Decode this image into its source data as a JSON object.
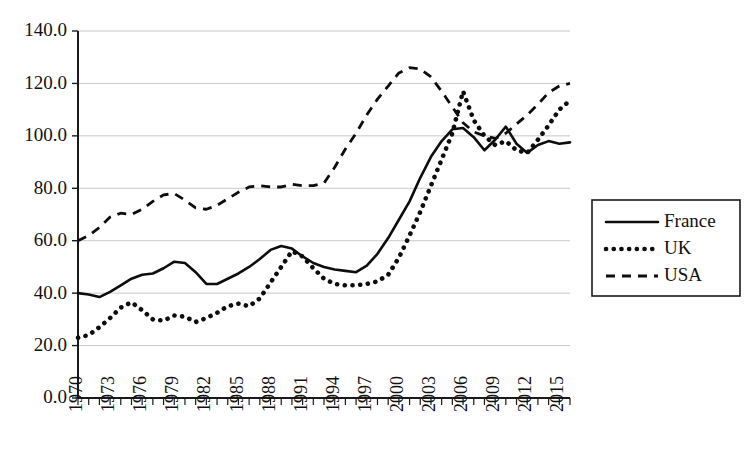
{
  "chart_data": {
    "type": "line",
    "title": "",
    "subtitle": "",
    "xlabel": "",
    "ylabel": "",
    "grid": true,
    "legend_position": "right",
    "xlim": [
      1970,
      2016
    ],
    "ylim": [
      0.0,
      140.0
    ],
    "y_ticks": [
      "0.0",
      "20.0",
      "40.0",
      "60.0",
      "80.0",
      "100.0",
      "120.0",
      "140.0"
    ],
    "y_tick_values": [
      0,
      20,
      40,
      60,
      80,
      100,
      120,
      140
    ],
    "x_tick_labels": [
      "1970",
      "1973",
      "1976",
      "1979",
      "1982",
      "1985",
      "1988",
      "1991",
      "1994",
      "1997",
      "2000",
      "2003",
      "2006",
      "2009",
      "2012",
      "2015"
    ],
    "x_tick_label_values": [
      1970,
      1973,
      1976,
      1979,
      1982,
      1985,
      1988,
      1991,
      1994,
      1997,
      2000,
      2003,
      2006,
      2009,
      2012,
      2015
    ],
    "x": [
      1970,
      1971,
      1972,
      1973,
      1974,
      1975,
      1976,
      1977,
      1978,
      1979,
      1980,
      1981,
      1982,
      1983,
      1984,
      1985,
      1986,
      1987,
      1988,
      1989,
      1990,
      1991,
      1992,
      1993,
      1994,
      1995,
      1996,
      1997,
      1998,
      1999,
      2000,
      2001,
      2002,
      2003,
      2004,
      2005,
      2006,
      2007,
      2008,
      2009,
      2010,
      2011,
      2012,
      2013,
      2014,
      2015,
      2016
    ],
    "series": [
      {
        "name": "France",
        "style": "solid",
        "color": "#0d0d0d",
        "values": [
          40.0,
          39.5,
          38.5,
          40.5,
          43.0,
          45.5,
          47.0,
          47.5,
          49.5,
          52.0,
          51.5,
          48.0,
          43.5,
          43.5,
          45.5,
          47.5,
          50.0,
          53.0,
          56.5,
          58.0,
          57.0,
          54.0,
          51.5,
          50.0,
          49.0,
          48.5,
          48.0,
          50.5,
          55.0,
          61.0,
          68.0,
          75.0,
          84.0,
          92.0,
          98.0,
          102.5,
          103.0,
          99.5,
          94.5,
          98.5,
          103.5,
          97.0,
          93.5,
          96.5,
          98.0,
          97.0,
          97.5
        ]
      },
      {
        "name": "UK",
        "style": "dotted",
        "color": "#0d0d0d",
        "values": [
          23.0,
          24.0,
          27.0,
          30.5,
          34.5,
          36.5,
          33.5,
          30.0,
          29.5,
          31.5,
          31.0,
          29.0,
          30.5,
          32.5,
          35.0,
          36.0,
          35.0,
          38.0,
          44.0,
          50.0,
          56.0,
          54.0,
          49.5,
          45.5,
          43.5,
          43.0,
          43.0,
          43.5,
          44.5,
          47.0,
          53.5,
          62.0,
          71.0,
          81.0,
          91.0,
          101.0,
          117.0,
          106.0,
          100.0,
          96.5,
          98.0,
          94.5,
          93.5,
          98.5,
          104.0,
          110.0,
          113.5
        ]
      },
      {
        "name": "USA",
        "style": "dashed",
        "color": "#0d0d0d",
        "values": [
          60.0,
          62.0,
          65.0,
          69.0,
          70.5,
          70.0,
          72.0,
          75.0,
          77.5,
          78.0,
          75.5,
          72.5,
          72.0,
          73.5,
          76.0,
          78.5,
          80.5,
          81.0,
          80.5,
          80.5,
          81.5,
          81.0,
          81.0,
          82.0,
          88.0,
          95.0,
          101.0,
          108.0,
          114.0,
          119.0,
          124.0,
          126.0,
          125.5,
          122.5,
          117.0,
          111.0,
          105.0,
          101.5,
          100.0,
          99.0,
          101.0,
          104.5,
          108.0,
          112.0,
          116.5,
          119.0,
          120.0
        ]
      }
    ],
    "legend": [
      {
        "label": "France",
        "style": "solid"
      },
      {
        "label": "UK",
        "style": "dotted"
      },
      {
        "label": "USA",
        "style": "dashed"
      }
    ]
  }
}
